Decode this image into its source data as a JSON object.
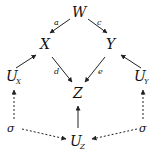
{
  "diagram": {
    "type": "causal-graph",
    "nodes": [
      {
        "id": "W",
        "label": "W",
        "sub": ""
      },
      {
        "id": "X",
        "label": "X",
        "sub": ""
      },
      {
        "id": "Y",
        "label": "Y",
        "sub": ""
      },
      {
        "id": "Z",
        "label": "Z",
        "sub": ""
      },
      {
        "id": "UX",
        "label": "U",
        "sub": "X"
      },
      {
        "id": "UY",
        "label": "U",
        "sub": "Y"
      },
      {
        "id": "UZ",
        "label": "U",
        "sub": "Z"
      },
      {
        "id": "sigmaL",
        "label": "σ",
        "sub": ""
      },
      {
        "id": "sigmaR",
        "label": "σ",
        "sub": ""
      }
    ],
    "edges": [
      {
        "from": "W",
        "to": "X",
        "label": "a",
        "style": "solid"
      },
      {
        "from": "W",
        "to": "Y",
        "label": "c",
        "style": "solid"
      },
      {
        "from": "X",
        "to": "Z",
        "label": "d",
        "style": "solid"
      },
      {
        "from": "Y",
        "to": "Z",
        "label": "e",
        "style": "solid"
      },
      {
        "from": "UX",
        "to": "X",
        "label": "",
        "style": "solid"
      },
      {
        "from": "UY",
        "to": "Y",
        "label": "",
        "style": "solid"
      },
      {
        "from": "UZ",
        "to": "Z",
        "label": "",
        "style": "solid"
      },
      {
        "from": "sigmaL",
        "to": "UX",
        "label": "",
        "style": "dashed"
      },
      {
        "from": "sigmaR",
        "to": "UY",
        "label": "",
        "style": "dashed"
      },
      {
        "from": "sigmaL",
        "to": "UZ",
        "label": "",
        "style": "dashed"
      },
      {
        "from": "sigmaR",
        "to": "UZ",
        "label": "",
        "style": "dashed"
      }
    ]
  }
}
